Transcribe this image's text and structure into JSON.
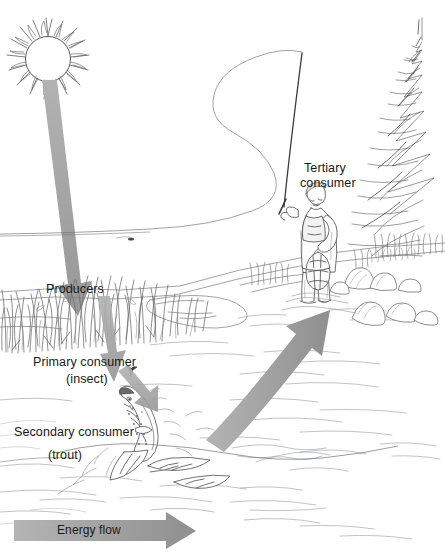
{
  "figure": {
    "style": "pen-and-ink line drawing, grayscale",
    "background_color": "#ffffff",
    "ink_color": "#4a4a4a",
    "text_color": "#1a1a1a",
    "arrow_color": "#a3a3a3",
    "arrow_color_dark": "#949494"
  },
  "labels": {
    "producers": "Producers",
    "primary_consumer": "Primary consumer",
    "primary_consumer_sub": "(insect)",
    "secondary_consumer": "Secondary consumer",
    "secondary_consumer_sub": "(trout)",
    "tertiary_consumer_line1": "Tertiary",
    "tertiary_consumer_line2": "consumer",
    "energy_flow": "Energy flow"
  },
  "icons": {
    "sun": "sun-icon",
    "insect": "insect-icon",
    "trout": "trout-icon",
    "angler": "fisherman-icon",
    "conifer": "pine-tree-icon",
    "grass": "grass-icon",
    "rocks": "rocks-icon",
    "water": "water-ripples-icon",
    "fishing_rod": "fishing-rod-icon",
    "fishing_line": "fishing-line-icon"
  },
  "arrows": [
    {
      "name": "sun-to-producers-arrow",
      "from": "sun",
      "to": "producers",
      "direction": "down",
      "color": "#a3a3a3"
    },
    {
      "name": "producers-to-insect-arrow",
      "from": "producers",
      "to": "primary consumer (insect)",
      "direction": "down",
      "color": "#9e9e9e"
    },
    {
      "name": "insect-to-trout-arrow",
      "from": "primary consumer (insect)",
      "to": "secondary consumer (trout)",
      "direction": "down-right",
      "color": "#a8a8a8"
    },
    {
      "name": "trout-to-angler-arrow",
      "from": "secondary consumer (trout)",
      "to": "tertiary consumer (angler)",
      "direction": "up-right curved",
      "color": "#a3a3a3"
    },
    {
      "name": "energy-flow-arrow",
      "from": "left",
      "to": "right",
      "direction": "right",
      "color": "#a8a8a8"
    }
  ]
}
